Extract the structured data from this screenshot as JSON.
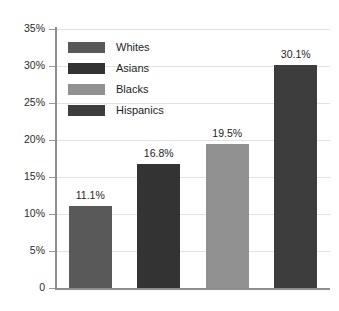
{
  "chart_data": {
    "type": "bar",
    "title": "",
    "xlabel": "",
    "ylabel": "",
    "categories": [
      "Whites",
      "Asians",
      "Blacks",
      "Hispanics"
    ],
    "values": [
      11.1,
      16.8,
      19.5,
      30.1
    ],
    "value_labels": [
      "11.1%",
      "16.8%",
      "19.5%",
      "30.1%"
    ],
    "ylim": [
      0,
      35
    ],
    "ytick_values": [
      0,
      5,
      10,
      15,
      20,
      25,
      30,
      35
    ],
    "ytick_labels": [
      "0",
      "5%",
      "10%",
      "15%",
      "20%",
      "25%",
      "30%",
      "35%"
    ],
    "grid": true,
    "legend_position": "inside-top-left",
    "series": [
      {
        "name": "Whites",
        "value": 11.1,
        "label": "11.1%",
        "color": "#595959"
      },
      {
        "name": "Asians",
        "value": 16.8,
        "label": "16.8%",
        "color": "#333333"
      },
      {
        "name": "Blacks",
        "value": 19.5,
        "label": "19.5%",
        "color": "#919191"
      },
      {
        "name": "Hispanics",
        "value": 30.1,
        "label": "30.1%",
        "color": "#3d3d3d"
      }
    ]
  },
  "legend": {
    "items": [
      {
        "label": "Whites",
        "color": "#595959"
      },
      {
        "label": "Asians",
        "color": "#333333"
      },
      {
        "label": "Blacks",
        "color": "#919191"
      },
      {
        "label": "Hispanics",
        "color": "#3d3d3d"
      }
    ]
  },
  "axis": {
    "grid_color": "#e2e2e2",
    "spine_color": "#8d8d8d",
    "label_color": "#2b2b2b"
  }
}
